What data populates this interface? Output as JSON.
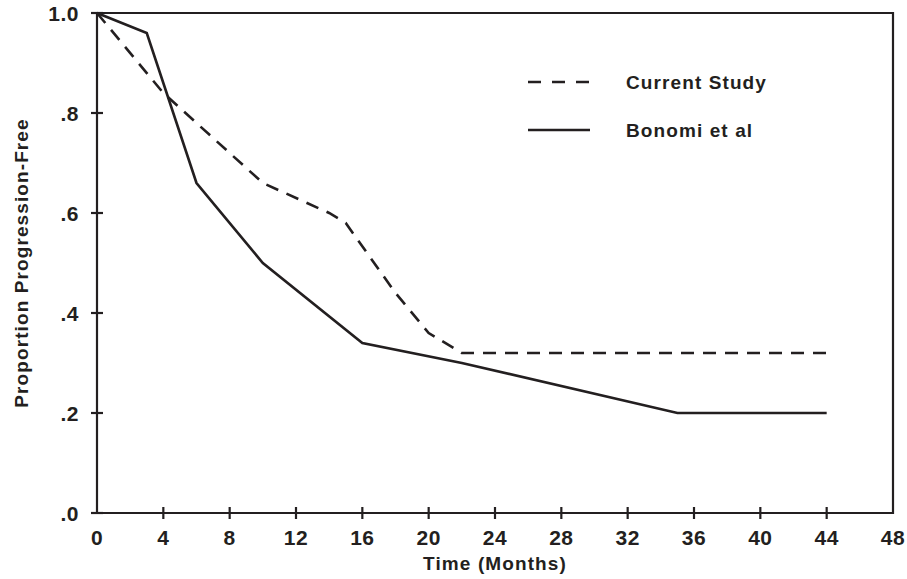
{
  "chart_data": {
    "type": "line",
    "title": "",
    "subtitle": "",
    "xlabel": "Time (Months)",
    "ylabel": "Proportion Progression-Free",
    "xlim": [
      0,
      48
    ],
    "ylim": [
      0,
      1.0
    ],
    "xticks": [
      0,
      4,
      8,
      12,
      16,
      20,
      24,
      28,
      32,
      36,
      40,
      44,
      48
    ],
    "xtick_labels": [
      "0",
      "4",
      "8",
      "12",
      "16",
      "20",
      "24",
      "28",
      "32",
      "36",
      "40",
      "44",
      "48"
    ],
    "yticks": [
      0.0,
      0.2,
      0.4,
      0.6,
      0.8,
      1.0
    ],
    "ytick_labels": [
      ".0",
      ".2",
      ".4",
      ".6",
      ".8",
      "1.0"
    ],
    "grid": false,
    "legend_position": "upper right",
    "series": [
      {
        "name": "Current Study",
        "style": "dashed",
        "color": "#231f20",
        "points": [
          [
            0,
            1.0
          ],
          [
            4,
            0.84
          ],
          [
            6,
            0.78
          ],
          [
            10,
            0.66
          ],
          [
            14,
            0.6
          ],
          [
            15,
            0.58
          ],
          [
            18,
            0.44
          ],
          [
            20,
            0.36
          ],
          [
            22,
            0.32
          ],
          [
            44,
            0.32
          ]
        ]
      },
      {
        "name": "Bonomi et al",
        "style": "solid",
        "color": "#231f20",
        "points": [
          [
            0,
            1.0
          ],
          [
            3,
            0.96
          ],
          [
            6,
            0.66
          ],
          [
            10,
            0.5
          ],
          [
            16,
            0.34
          ],
          [
            22,
            0.3
          ],
          [
            35,
            0.2
          ],
          [
            44,
            0.2
          ]
        ]
      }
    ]
  },
  "legend": {
    "entries": [
      {
        "label": "Current Study",
        "style": "dashed"
      },
      {
        "label": "Bonomi et al",
        "style": "solid"
      }
    ]
  }
}
